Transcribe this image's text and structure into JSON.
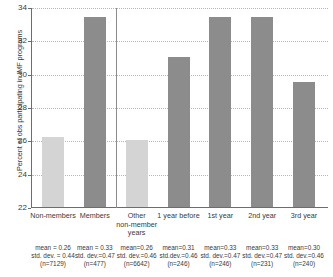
{
  "chart_data": {
    "type": "bar",
    "title": "",
    "xlabel": "",
    "ylabel": "Percent of obs participating in IMF programs",
    "ylim": [
      22,
      34
    ],
    "yticks": [
      22,
      24,
      26,
      28,
      30,
      32,
      34
    ],
    "grid": true,
    "legend": "none",
    "categories": [
      "Non-members",
      "Members",
      "Other\nnon-member\nyears",
      "1 year before",
      "1st year",
      "2nd year",
      "3rd year"
    ],
    "values": [
      26.2,
      33.4,
      26.0,
      31.0,
      33.4,
      33.4,
      29.5
    ],
    "bar_colors": [
      "#d4d4d4",
      "#8c8c8c",
      "#d4d4d4",
      "#8c8c8c",
      "#8c8c8c",
      "#8c8c8c",
      "#8c8c8c"
    ],
    "panel_separator_after_index": 1,
    "annotations": [
      {
        "mean": "mean = 0.26",
        "std": "std. dev. = 0.44",
        "n": "(n=7129)"
      },
      {
        "mean": "mean = 0.33",
        "std": "std. dev.=0.47",
        "n": "(n=477)"
      },
      {
        "mean": "mean=0.26",
        "std": "std. dev.=0.46",
        "n": "(n=6642)"
      },
      {
        "mean": "mean=0.31",
        "std": "std.dev.=0.46",
        "n": "(n=246)"
      },
      {
        "mean": "mean=0.33",
        "std": "std. dev.=0.47",
        "n": "(n=246)"
      },
      {
        "mean": "mean=0.33",
        "std": "std. dev.=0.47",
        "n": "(n=231)"
      },
      {
        "mean": "mean=0.30",
        "std": "std. dev.=0.46",
        "n": "(n=240)"
      }
    ]
  },
  "axis": {
    "ylabel": "Percent of obs participating in IMF programs",
    "ticks": [
      "34",
      "32",
      "30",
      "28",
      "26",
      "24",
      "22"
    ]
  },
  "categories": [
    {
      "line1": "Non-members",
      "line2": "",
      "line3": ""
    },
    {
      "line1": "Members",
      "line2": "",
      "line3": ""
    },
    {
      "line1": "Other",
      "line2": "non-member",
      "line3": "years"
    },
    {
      "line1": "1 year before",
      "line2": "",
      "line3": ""
    },
    {
      "line1": "1st year",
      "line2": "",
      "line3": ""
    },
    {
      "line1": "2nd year",
      "line2": "",
      "line3": ""
    },
    {
      "line1": "3rd year",
      "line2": "",
      "line3": ""
    }
  ],
  "stats": [
    {
      "mean": "mean = 0.26",
      "std": "std. dev. = 0.44",
      "n": "(n=7129)"
    },
    {
      "mean": "mean = 0.33",
      "std": "std. dev.=0.47",
      "n": "(n=477)"
    },
    {
      "mean": "mean=0.26",
      "std": "std. dev.=0.46",
      "n": "(n=6642)"
    },
    {
      "mean": "mean=0.31",
      "std": "std.dev.=0.46",
      "n": "(n=246)"
    },
    {
      "mean": "mean=0.33",
      "std": "std. dev.=0.47",
      "n": "(n=246)"
    },
    {
      "mean": "mean=0.33",
      "std": "std. dev.=0.47",
      "n": "(n=231)"
    },
    {
      "mean": "mean=0.30",
      "std": "std. dev.=0.46",
      "n": "(n=240)"
    }
  ]
}
